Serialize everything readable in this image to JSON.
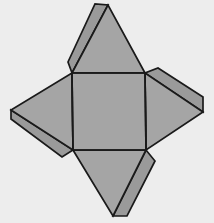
{
  "figure": {
    "canvas": {
      "width": 214,
      "height": 223
    },
    "colors": {
      "background": "#ededed",
      "face_fill": "#a5a5a5",
      "flap_fill": "#9a9a9a",
      "outline": "#1a1a1a"
    },
    "stroke_width": 1.7
  },
  "geometry": {
    "square_base": {
      "label": "base-square",
      "points": "72,73 145,73 146,150 73,150",
      "corners": {
        "top_left": [
          72,
          73
        ],
        "top_right": [
          145,
          73
        ],
        "bottom_right": [
          146,
          150
        ],
        "bottom_left": [
          73,
          150
        ]
      }
    },
    "faces": [
      {
        "label": "triangle-top",
        "points": "72,73 145,73 108,5",
        "apex": [
          108,
          5
        ]
      },
      {
        "label": "triangle-right",
        "points": "145,73 146,150 203,112",
        "apex": [
          203,
          112
        ]
      },
      {
        "label": "triangle-bottom",
        "points": "73,150 146,150 113,216",
        "apex": [
          113,
          216
        ]
      },
      {
        "label": "triangle-left",
        "points": "72,73 73,150 11,110",
        "apex": [
          11,
          110
        ]
      }
    ],
    "flaps": [
      {
        "label": "flap-top-left-edge",
        "points": "72,73 108,5 95,4 68,62"
      },
      {
        "label": "flap-right-top-edge",
        "points": "145,73 203,112 203,97 158,68"
      },
      {
        "label": "flap-bottom-right-edge",
        "points": "146,150 113,216 127,216 155,161"
      },
      {
        "label": "flap-left-bottom-edge",
        "points": "73,150 11,110 11,119 62,157"
      }
    ],
    "fold_lines": [
      {
        "label": "fold-top",
        "path": "M 72,73 L 145,73"
      },
      {
        "label": "fold-right",
        "path": "M 145,73 L 146,150"
      },
      {
        "label": "fold-bottom",
        "path": "M 73,150 L 146,150"
      },
      {
        "label": "fold-left",
        "path": "M 72,73 L 73,150"
      }
    ]
  }
}
